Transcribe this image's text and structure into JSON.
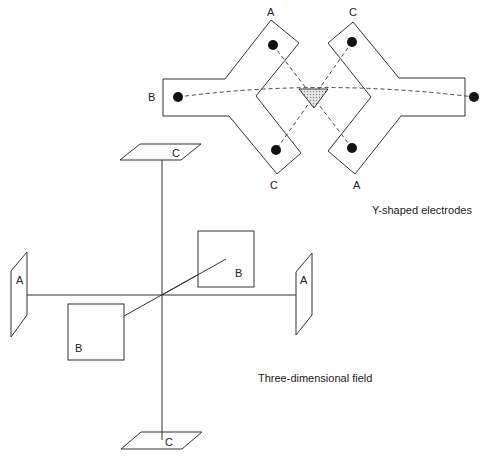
{
  "diagram": {
    "y_shaped": {
      "caption": "Y-shaped electrodes",
      "left_electrode": {
        "top_label": "A",
        "side_label": "B",
        "bottom_label": "C"
      },
      "right_electrode": {
        "top_label": "C",
        "side_label": "B",
        "bottom_label": "A"
      },
      "center_marker_color": "#bbbbbb"
    },
    "three_d_field": {
      "caption": "Three-dimensional field",
      "plates": {
        "top": "C",
        "bottom": "C",
        "left": "A",
        "right": "A",
        "back": "B",
        "front": "B"
      }
    }
  }
}
